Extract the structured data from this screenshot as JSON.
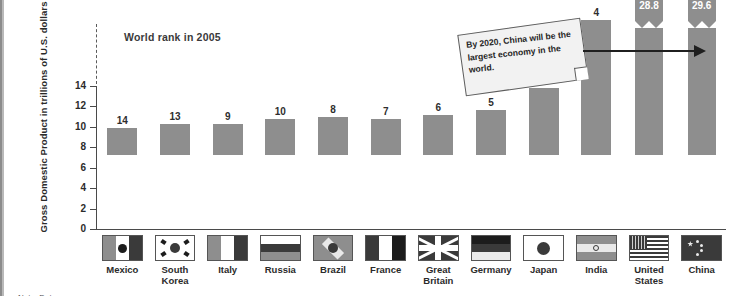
{
  "chart_data": {
    "type": "bar",
    "title": "World rank in 2005",
    "xlabel": "",
    "ylabel": "Gross Domestic Product in trillions of  U.S. dollars",
    "ylim": [
      0,
      14
    ],
    "yticks": [
      0,
      2,
      4,
      6,
      8,
      10,
      12,
      14
    ],
    "grid": false,
    "legend": "none",
    "axis_break": true,
    "categories": [
      "Mexico",
      "South Korea",
      "Italy",
      "Russia",
      "Brazil",
      "France",
      "Great Britain",
      "Germany",
      "Japan",
      "India",
      "United States",
      "China"
    ],
    "values": [
      2.6,
      3.0,
      3.0,
      3.5,
      3.7,
      3.5,
      3.9,
      4.4,
      6.6,
      13.2,
      28.8,
      29.6
    ],
    "ranks": [
      "14",
      "13",
      "9",
      "10",
      "8",
      "7",
      "6",
      "5",
      "3",
      "4",
      "1",
      "2"
    ],
    "value_labels": [
      "",
      "",
      "",
      "",
      "",
      "",
      "",
      "",
      "",
      "",
      "28.8",
      "29.6"
    ],
    "broken_bars": [
      "United States",
      "China"
    ]
  },
  "annotation": {
    "callout_text": "By 2020, China will be the largest economy in the world.",
    "points_to": "China"
  },
  "footer": {
    "note": "Note: Data ..."
  },
  "colors": {
    "bar": "#8e8e8e",
    "axis": "#4a4a4a",
    "text": "#2b2b2b",
    "callout_bg": "#f2f2f2",
    "arrow": "#1f1f1f"
  }
}
